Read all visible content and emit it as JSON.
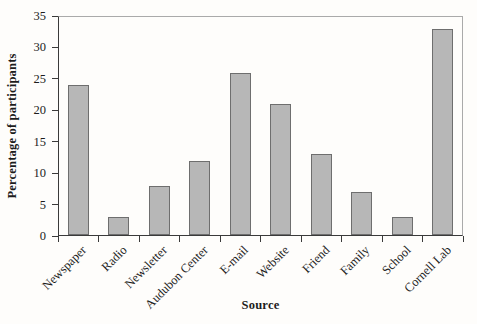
{
  "chart_data": {
    "type": "bar",
    "title": "",
    "xlabel": "Source",
    "ylabel": "Percentage of participants",
    "categories": [
      "Newspaper",
      "Radio",
      "Newsletter",
      "Audubon Center",
      "E-mail",
      "Website",
      "Friend",
      "Family",
      "School",
      "Cornell Lab"
    ],
    "values": [
      24,
      3,
      8,
      12,
      26,
      21,
      13,
      7,
      3,
      33
    ],
    "ylim": [
      0,
      35
    ],
    "ytick_step": 5,
    "yticks": [
      0,
      5,
      10,
      15,
      20,
      25,
      30,
      35
    ],
    "grid": false,
    "legend": "none",
    "bar_fill": "#b7b7b7",
    "bar_border": "#6e6e6e",
    "axis_color": "#3a3a3a",
    "frame_color": "#aaaaaa",
    "text_color": "#1c1c1c",
    "background": "#fefdfb"
  }
}
